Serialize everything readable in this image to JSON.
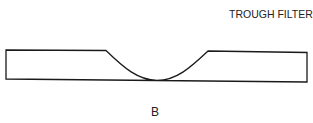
{
  "diagram": {
    "title": "TROUGH FILTER",
    "label": "B",
    "shape": {
      "type": "trough-filter-profile",
      "description": "Flat rectangular strip with a single rounded trough notch cut into the top edge at the center",
      "stroke_color": "#1a1a1a"
    }
  }
}
